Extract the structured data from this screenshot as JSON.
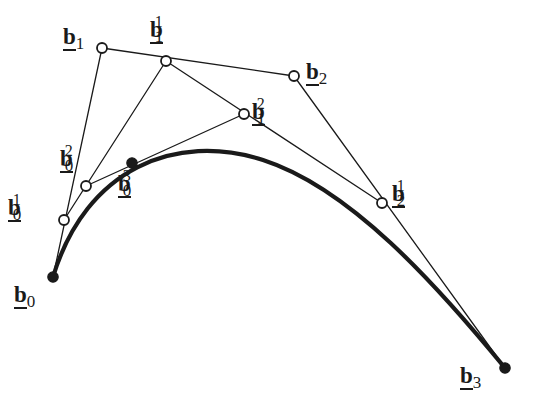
{
  "figure": {
    "width": 540,
    "height": 407,
    "background": "#ffffff",
    "ink_color": "#1a1a1a",
    "curve_stroke_width": 4.2,
    "polyline_stroke_width": 1.3,
    "open_marker_radius": 5.0,
    "filled_marker_radius": 5.2
  },
  "points": [
    {
      "id": "b0",
      "base": "b",
      "sub": "0",
      "sup": "",
      "x": 53,
      "y": 277,
      "marker": "filled",
      "label_x": 14,
      "label_y": 283
    },
    {
      "id": "b01",
      "base": "b",
      "sub": "0",
      "sup": "1",
      "x": 64,
      "y": 220,
      "marker": "open",
      "label_x": 8,
      "label_y": 196
    },
    {
      "id": "b02",
      "base": "b",
      "sub": "0",
      "sup": "2",
      "x": 86,
      "y": 186,
      "marker": "open",
      "label_x": 60,
      "label_y": 147
    },
    {
      "id": "b03",
      "base": "b",
      "sub": "0",
      "sup": "3",
      "x": 132,
      "y": 163,
      "marker": "filled",
      "label_x": 118,
      "label_y": 172
    },
    {
      "id": "b1",
      "base": "b",
      "sub": "1",
      "sup": "",
      "x": 102,
      "y": 48,
      "marker": "open",
      "label_x": 63,
      "label_y": 25
    },
    {
      "id": "b11",
      "base": "b",
      "sub": "1",
      "sup": "1",
      "x": 166,
      "y": 61,
      "marker": "open",
      "label_x": 150,
      "label_y": 18
    },
    {
      "id": "b12",
      "base": "b",
      "sub": "1",
      "sup": "2",
      "x": 244,
      "y": 114,
      "marker": "open",
      "label_x": 252,
      "label_y": 100
    },
    {
      "id": "b2",
      "base": "b",
      "sub": "2",
      "sup": "",
      "x": 294,
      "y": 76,
      "marker": "open",
      "label_x": 306,
      "label_y": 60
    },
    {
      "id": "b21",
      "base": "b",
      "sub": "2",
      "sup": "1",
      "x": 382,
      "y": 203,
      "marker": "open",
      "label_x": 392,
      "label_y": 182
    },
    {
      "id": "b3",
      "base": "b",
      "sub": "3",
      "sup": "",
      "x": 505,
      "y": 368,
      "marker": "filled",
      "label_x": 460,
      "label_y": 364
    }
  ],
  "polylines": [
    {
      "name": "control-polygon-level0",
      "points": [
        "b0",
        "b1",
        "b2",
        "b3"
      ]
    },
    {
      "name": "control-polygon-level1",
      "points": [
        "b01",
        "b11",
        "b21"
      ]
    },
    {
      "name": "control-polygon-level2",
      "points": [
        "b02",
        "b12"
      ]
    }
  ],
  "curve": {
    "name": "bezier-curve",
    "start": "b0",
    "end": "b3",
    "path": "M 53 277 C 86 168, 176 132, 263 160 C 350 188, 436 284, 505 368"
  }
}
